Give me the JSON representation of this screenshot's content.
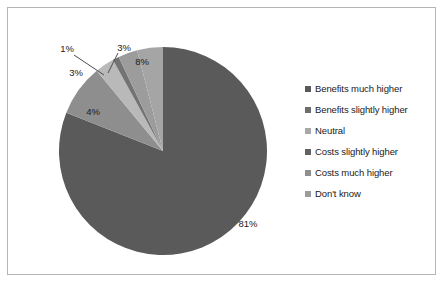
{
  "chart_data": {
    "type": "pie",
    "title": "",
    "categories": [
      "Benefits much higher",
      "Benefits slightly higher",
      "Neutral",
      "Costs slightly higher",
      "Costs much higher",
      "Don't know"
    ],
    "values": [
      81,
      8,
      3,
      1,
      3,
      4
    ],
    "data_labels": [
      "81%",
      "8%",
      "3%",
      "1%",
      "3%",
      "4%"
    ],
    "colors": [
      "#5a5a5a",
      "#8e8e8e",
      "#b9b9b9",
      "#737373",
      "#9c9c9c",
      "#a5a5a5"
    ],
    "legend_position": "right",
    "start_angle_deg": 0,
    "direction": "clockwise",
    "grid": false,
    "xlabel": "",
    "ylabel": ""
  },
  "legend": {
    "items": [
      {
        "label": "Benefits much higher",
        "color": "#5a5a5a"
      },
      {
        "label": "Benefits slightly higher",
        "color": "#6e6e6e"
      },
      {
        "label": "Neutral",
        "color": "#a8a8a8"
      },
      {
        "label": "Costs slightly higher",
        "color": "#626262"
      },
      {
        "label": "Costs much higher",
        "color": "#8e8e8e"
      },
      {
        "label": "Don't know",
        "color": "#9c9c9c"
      }
    ]
  },
  "labels": {
    "pct_81": "81%",
    "pct_8": "8%",
    "pct_3a": "3%",
    "pct_1": "1%",
    "pct_3b": "3%",
    "pct_4": "4%"
  },
  "colors": {
    "frame_border": "#b5b5b5",
    "background": "#ffffff",
    "text": "#1a1a1a",
    "leader": "#4d4d4d"
  }
}
